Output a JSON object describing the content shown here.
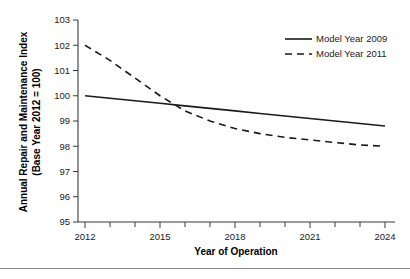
{
  "chart_data": {
    "type": "line",
    "title": "",
    "xlabel": "Year of Operation",
    "ylabel": "Annual Repair and Maintenance Index\n(Base Year 2012 = 100)",
    "ylabel_line1": "Annual Repair and Maintenance Index",
    "ylabel_line2": "(Base Year 2012 = 100)",
    "xlim": [
      2012,
      2024
    ],
    "ylim": [
      95,
      103
    ],
    "grid": false,
    "legend_position": "top-right",
    "x_tick_labels": [
      "2012",
      "2015",
      "2018",
      "2021",
      "2024"
    ],
    "x_tick_values": [
      2012,
      2015,
      2018,
      2021,
      2024
    ],
    "x_minor_ticks": [
      2013,
      2014,
      2016,
      2017,
      2019,
      2020,
      2022,
      2023
    ],
    "y_tick_labels": [
      "95",
      "96",
      "97",
      "98",
      "99",
      "100",
      "101",
      "102",
      "103"
    ],
    "y_tick_values": [
      95,
      96,
      97,
      98,
      99,
      100,
      101,
      102,
      103
    ],
    "x": [
      2012,
      2013,
      2014,
      2015,
      2016,
      2017,
      2018,
      2019,
      2020,
      2021,
      2022,
      2023,
      2024
    ],
    "series": [
      {
        "name": "Model Year 2009",
        "style": "solid",
        "color": "#1a1a1a",
        "values": [
          100.0,
          99.9,
          99.8,
          99.7,
          99.6,
          99.5,
          99.4,
          99.3,
          99.2,
          99.1,
          99.0,
          98.9,
          98.8
        ]
      },
      {
        "name": "Model Year 2011",
        "style": "dashed",
        "color": "#1a1a1a",
        "values": [
          102.0,
          101.4,
          100.7,
          100.0,
          99.4,
          99.0,
          98.7,
          98.5,
          98.35,
          98.25,
          98.15,
          98.05,
          98.0
        ]
      }
    ],
    "legend": [
      {
        "label": "Model Year 2009",
        "style": "solid"
      },
      {
        "label": "Model Year 2011",
        "style": "dashed"
      }
    ],
    "annotations": []
  },
  "footer": {
    "rule_visible": true
  }
}
